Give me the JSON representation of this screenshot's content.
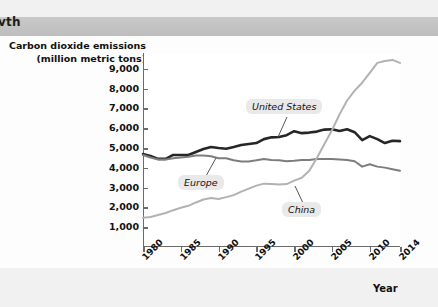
{
  "page": {
    "header_partial_text": "vth",
    "background_color": "#f1f1f1",
    "panel_color": "#fdfdfd"
  },
  "chart_data": {
    "type": "line",
    "title": "",
    "xlabel": "Year",
    "ylabel_line1": "Carbon dioxide emissions",
    "ylabel_line2": "(million metric tons)",
    "xlim": [
      1980,
      2014
    ],
    "ylim": [
      0,
      9800
    ],
    "grid": false,
    "legend_position": "inline-callouts",
    "ytick_labels": [
      "9,000",
      "8,000",
      "7,000",
      "6,000",
      "5,000",
      "4,000",
      "3,000",
      "2,000",
      "1,000"
    ],
    "ytick_values": [
      9000,
      8000,
      7000,
      6000,
      5000,
      4000,
      3000,
      2000,
      1000
    ],
    "xtick_labels": [
      "1980",
      "1985",
      "1990",
      "1995",
      "2000",
      "2005",
      "2010",
      "2014"
    ],
    "xtick_values": [
      1980,
      1985,
      1990,
      1995,
      2000,
      2005,
      2010,
      2014
    ],
    "x": [
      1980,
      1981,
      1982,
      1983,
      1984,
      1985,
      1986,
      1987,
      1988,
      1989,
      1990,
      1991,
      1992,
      1993,
      1994,
      1995,
      1996,
      1997,
      1998,
      1999,
      2000,
      2001,
      2002,
      2003,
      2004,
      2005,
      2006,
      2007,
      2008,
      2009,
      2010,
      2011,
      2012,
      2013,
      2014
    ],
    "series": [
      {
        "name": "United States",
        "color": "#262626",
        "values": [
          4700,
          4600,
          4450,
          4450,
          4650,
          4650,
          4650,
          4800,
          4950,
          5050,
          5000,
          4960,
          5050,
          5150,
          5200,
          5250,
          5450,
          5540,
          5560,
          5650,
          5850,
          5750,
          5780,
          5830,
          5930,
          5950,
          5860,
          5950,
          5800,
          5400,
          5600,
          5450,
          5250,
          5370,
          5350
        ]
      },
      {
        "name": "Europe",
        "color": "#7d7d7d",
        "values": [
          4650,
          4520,
          4420,
          4420,
          4480,
          4520,
          4560,
          4620,
          4620,
          4580,
          4480,
          4480,
          4380,
          4320,
          4320,
          4380,
          4450,
          4400,
          4380,
          4330,
          4360,
          4400,
          4400,
          4450,
          4450,
          4440,
          4420,
          4400,
          4330,
          4060,
          4180,
          4060,
          4010,
          3930,
          3850
        ]
      },
      {
        "name": "China",
        "color": "#b2b2b2",
        "values": [
          1480,
          1520,
          1620,
          1720,
          1860,
          1980,
          2080,
          2250,
          2400,
          2480,
          2420,
          2520,
          2620,
          2800,
          2950,
          3100,
          3200,
          3180,
          3160,
          3180,
          3350,
          3500,
          3850,
          4500,
          5200,
          5900,
          6700,
          7400,
          7900,
          8300,
          8800,
          9300,
          9400,
          9450,
          9300
        ]
      }
    ],
    "annotations": [
      {
        "label": "United States",
        "series": "United States"
      },
      {
        "label": "Europe",
        "series": "Europe"
      },
      {
        "label": "China",
        "series": "China"
      }
    ]
  }
}
